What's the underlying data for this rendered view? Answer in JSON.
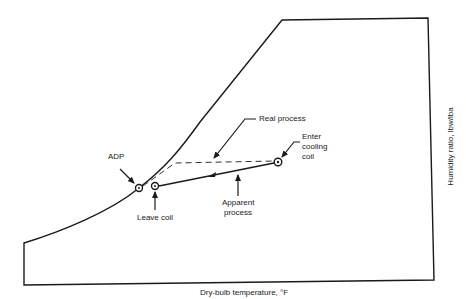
{
  "diagram": {
    "type": "psychrometric-chart-cooling-coil-process",
    "axes": {
      "xlabel": "Dry-bulb temperature, °F",
      "ylabel": "Humidity ratio, lbw/lba"
    },
    "points": {
      "adp": {
        "label": "ADP"
      },
      "leave_coil": {
        "label": "Leave coil"
      },
      "enter_coil": {
        "label_lines": [
          "Enter",
          "cooling",
          "coil"
        ]
      }
    },
    "processes": {
      "real": {
        "label": "Real process",
        "style": "dashed"
      },
      "apparent": {
        "label_lines": [
          "Apparent",
          "process"
        ],
        "style": "solid"
      }
    },
    "colors": {
      "ink": "#1a1a1a",
      "background": "#ffffff"
    }
  }
}
